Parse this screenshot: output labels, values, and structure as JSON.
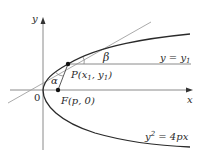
{
  "figure": {
    "type": "parabola-reflection-diagram",
    "axes": {
      "x_label": "x",
      "y_label": "y",
      "origin_label": "0"
    },
    "curve": {
      "equation": "y² = 4px",
      "eq_lhs": "y",
      "eq_sup": "2",
      "eq_rhs": " = 4px"
    },
    "line": {
      "equation": "y = y₁",
      "eq_text": "y = y",
      "eq_sub": "1"
    },
    "point_P": {
      "label": "P(x₁, y₁)",
      "name": "P",
      "x_sub": "1",
      "y_sub": "1"
    },
    "focus": {
      "label": "F(p, 0)"
    },
    "angles": {
      "alpha": "α",
      "beta": "β"
    },
    "colors": {
      "curve": "#2a2a2a",
      "axis": "#8a8a8a",
      "tangent": "#9a9a9a",
      "text": "#2a2a2a"
    }
  }
}
